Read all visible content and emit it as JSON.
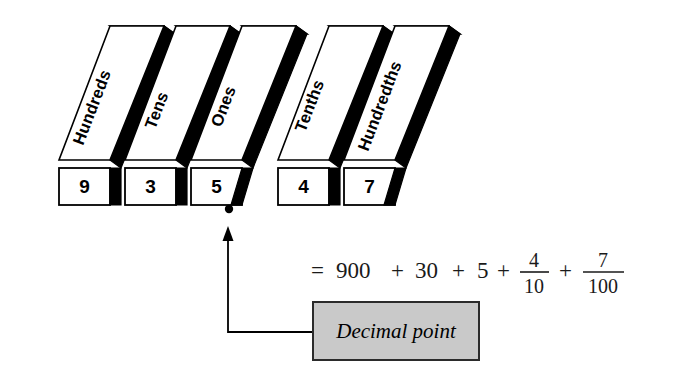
{
  "figure": {
    "number_shown": "935.47",
    "columns": [
      {
        "label": "Hundreds",
        "digit": "9"
      },
      {
        "label": "Tens",
        "digit": "3"
      },
      {
        "label": "Ones",
        "digit": "5"
      },
      {
        "label": "Tenths",
        "digit": "4"
      },
      {
        "label": "Hundredths",
        "digit": "7"
      }
    ],
    "decimal_point_symbol": ".",
    "callout": {
      "label": "Decimal point",
      "fill_color": "#c9c9c9",
      "border_color": "#2b2b2b"
    },
    "equation": {
      "equals": "=",
      "terms": [
        {
          "kind": "whole",
          "text": "900"
        },
        {
          "kind": "op",
          "text": "+"
        },
        {
          "kind": "whole",
          "text": "30"
        },
        {
          "kind": "op",
          "text": "+"
        },
        {
          "kind": "whole",
          "text": "5"
        },
        {
          "kind": "op",
          "text": "+"
        },
        {
          "kind": "fraction",
          "numerator": "4",
          "denominator": "10"
        },
        {
          "kind": "op",
          "text": "+"
        },
        {
          "kind": "fraction",
          "numerator": "7",
          "denominator": "100"
        }
      ],
      "full_text": "= 900 + 30 + 5 + 4/10 + 7/100"
    },
    "colors": {
      "ink": "#000000",
      "paper": "#ffffff",
      "callout_fill": "#c9c9c9"
    }
  }
}
